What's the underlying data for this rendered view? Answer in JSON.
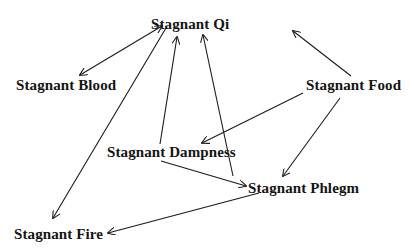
{
  "diagram": {
    "type": "directed-graph",
    "nodes": {
      "qi": {
        "label": "Stagnant Qi",
        "x": 151,
        "y": 16
      },
      "blood": {
        "label": "Stagnant Blood",
        "x": 16,
        "y": 77
      },
      "food": {
        "label": "Stagnant Food",
        "x": 306,
        "y": 77
      },
      "dampness": {
        "label": "Stagnant Dampness",
        "x": 107,
        "y": 144
      },
      "phlegm": {
        "label": "Stagnant Phlegm",
        "x": 248,
        "y": 180
      },
      "fire": {
        "label": "Stagnant Fire",
        "x": 14,
        "y": 226
      }
    },
    "edges": [
      {
        "from": "qi",
        "to": "blood",
        "bidirectional": true
      },
      {
        "from": "qi",
        "to": "fire",
        "bidirectional": false
      },
      {
        "from": "dampness",
        "to": "qi",
        "bidirectional": false
      },
      {
        "from": "phlegm",
        "to": "qi",
        "bidirectional": false
      },
      {
        "from": "food",
        "to": "qi",
        "bidirectional": false
      },
      {
        "from": "food",
        "to": "dampness",
        "bidirectional": false
      },
      {
        "from": "food",
        "to": "phlegm",
        "bidirectional": false
      },
      {
        "from": "dampness",
        "to": "phlegm",
        "bidirectional": false
      },
      {
        "from": "phlegm",
        "to": "fire",
        "bidirectional": false
      }
    ],
    "colors": {
      "background": "#ffffff",
      "line": "#1a1a1a",
      "text": "#141414"
    }
  }
}
